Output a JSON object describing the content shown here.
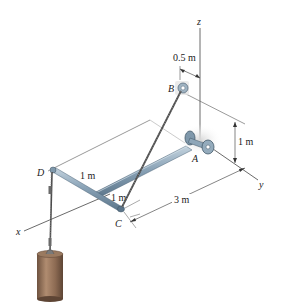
{
  "figure": {
    "type": "3d-statics-diagram",
    "axes": {
      "x_label": "x",
      "y_label": "y",
      "z_label": "z"
    },
    "points": {
      "A": "A",
      "B": "B",
      "C": "C",
      "D": "D"
    },
    "dimensions": {
      "B_offset": "0.5 m",
      "A_height": "1 m",
      "rod_length_y": "3 m",
      "DC_segment_upper": "1 m",
      "DC_segment_lower": "1 m"
    },
    "colors": {
      "rod": "#7c97ad",
      "rod_highlight": "#b7c9d6",
      "bearing": "#8fa6b8",
      "cable": "#555555",
      "weight": "#8a6a52",
      "weight_highlight": "#b8967a",
      "line": "#333333"
    }
  }
}
